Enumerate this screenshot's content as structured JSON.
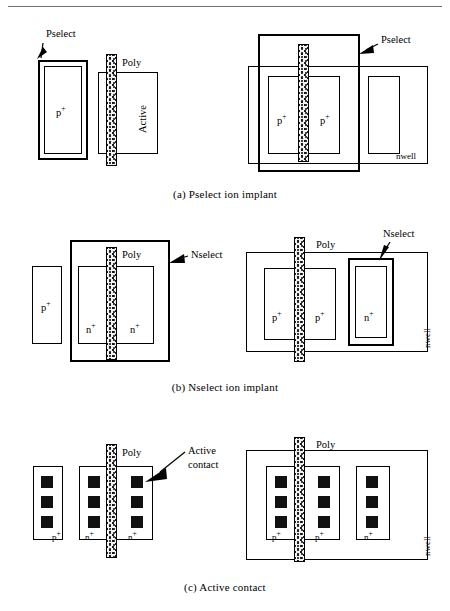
{
  "figure": {
    "title_rule": true,
    "panels": [
      {
        "id": "a",
        "caption": "(a)  Pselect ion implant",
        "left_diagram": {
          "labels": {
            "callout": "Pselect",
            "poly": "Poly",
            "active": "Active",
            "diffusion": "p",
            "diffusion_sup": "+"
          }
        },
        "right_diagram": {
          "labels": {
            "callout": "Pselect",
            "nwell": "nwell",
            "diffusion_left": "p",
            "diffusion_left_sup": "+",
            "diffusion_right": "p",
            "diffusion_right_sup": "+"
          }
        }
      },
      {
        "id": "b",
        "caption": "(b)  Nselect ion implant",
        "left_diagram": {
          "labels": {
            "callout": "Nselect",
            "poly": "Poly",
            "pplus": "p",
            "pplus_sup": "+",
            "nplus_left": "n",
            "nplus_left_sup": "+",
            "nplus_right": "n",
            "nplus_right_sup": "+"
          }
        },
        "right_diagram": {
          "labels": {
            "callout": "Nselect",
            "poly": "Poly",
            "nwell": "nwell",
            "pplus_left": "p",
            "pplus_left_sup": "+",
            "pplus_right": "p",
            "pplus_right_sup": "+",
            "nplus": "n",
            "nplus_sup": "+"
          }
        }
      },
      {
        "id": "c",
        "caption": "(c)  Active contact",
        "left_diagram": {
          "labels": {
            "callout_line1": "Active",
            "callout_line2": "contact",
            "poly": "Poly",
            "pplus": "p",
            "pplus_sup": "+",
            "nplus_left": "n",
            "nplus_left_sup": "+",
            "nplus_right": "n",
            "nplus_right_sup": "+"
          },
          "contacts_per_column": 3
        },
        "right_diagram": {
          "labels": {
            "poly": "Poly",
            "nwell": "nwell",
            "pplus_left": "p",
            "pplus_left_sup": "+",
            "pplus_right": "p",
            "pplus_right_sup": "+",
            "nplus": "n",
            "nplus_sup": "+"
          },
          "contacts_per_column": 3
        }
      }
    ]
  },
  "colors": {
    "ink": "#000000",
    "rule": "#6f6f6f",
    "poly_fill": "#f2f2f2",
    "contact_fill": "#111111"
  }
}
